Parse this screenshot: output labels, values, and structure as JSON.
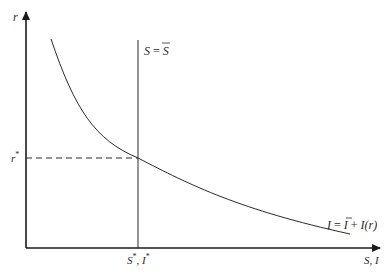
{
  "diagram": {
    "type": "economics-saving-investment",
    "y_axis_label": "r",
    "x_axis_label": "S, I",
    "vertical_line_label": {
      "lhs": "S",
      "eq": " = ",
      "rhs": "S"
    },
    "curve_label": {
      "lhs": "I",
      "eq": " = ",
      "bar": "I",
      "plus": " + ",
      "func": "I(r)"
    },
    "equilibrium_rate_label": "r",
    "equilibrium_rate_sup": "*",
    "equilibrium_quantity_label": "S",
    "equilibrium_quantity_sup": "*",
    "equilibrium_quantity_sep": ", ",
    "equilibrium_quantity_label2": "I",
    "equilibrium_quantity_sup2": "*",
    "colors": {
      "line": "#2a2a2a",
      "axis": "#1a1a1a"
    }
  }
}
